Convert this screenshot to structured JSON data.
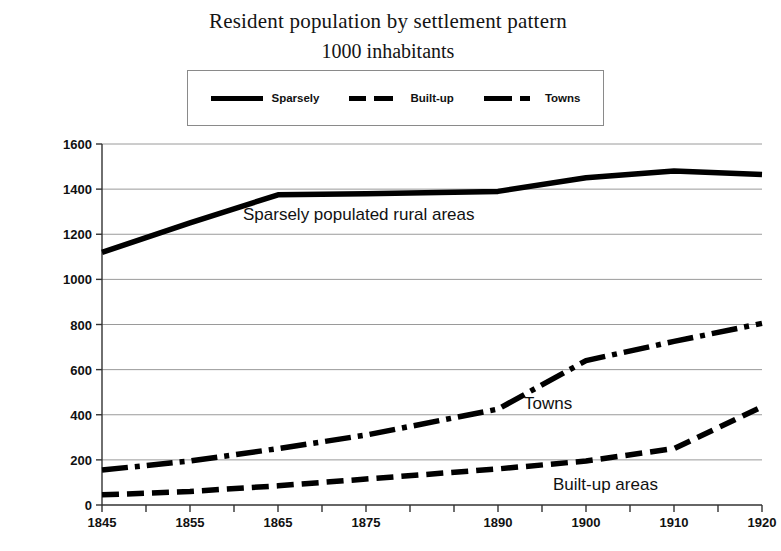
{
  "chart_data": {
    "type": "line",
    "title": "Resident population by settlement pattern",
    "subtitle": "1000 inhabitants",
    "xlabel": "",
    "ylabel": "",
    "grid": true,
    "legend_position": "top-center",
    "xlim": [
      1845,
      1920
    ],
    "ylim": [
      0,
      1600
    ],
    "ytick_values": [
      0,
      200,
      400,
      600,
      800,
      1000,
      1200,
      1400,
      1600
    ],
    "ytick_labels": [
      "0",
      "200",
      "400",
      "600",
      "800",
      "1000",
      "1200",
      "1400",
      "1600"
    ],
    "xtick_labels": [
      "1845",
      "1855",
      "1865",
      "1875",
      "1890",
      "1900",
      "1910",
      "1920"
    ],
    "xtick_positions": [
      1845,
      1855,
      1865,
      1875,
      1890,
      1900,
      1910,
      1920
    ],
    "minor_xticks": [
      1850,
      1860,
      1870,
      1880,
      1885,
      1895,
      1905,
      1915
    ],
    "x": [
      1845,
      1855,
      1865,
      1875,
      1890,
      1900,
      1910,
      1920
    ],
    "series": [
      {
        "name": "Sparsely",
        "style": "solid",
        "color": "#000000",
        "values": [
          1120,
          1250,
          1375,
          1380,
          1390,
          1450,
          1480,
          1465
        ]
      },
      {
        "name": "Built-up",
        "style": "dashed",
        "color": "#000000",
        "values": [
          45,
          60,
          85,
          115,
          160,
          195,
          250,
          435
        ]
      },
      {
        "name": "Towns",
        "style": "dash-dot",
        "color": "#000000",
        "values": [
          155,
          195,
          250,
          310,
          425,
          640,
          725,
          805
        ]
      }
    ],
    "annotations": [
      {
        "id": "sparsely",
        "text": "Sparsely populated rural areas"
      },
      {
        "id": "towns",
        "text": "Towns"
      },
      {
        "id": "builtup",
        "text": "Built-up areas"
      }
    ],
    "legend": [
      {
        "label": "Sparsely",
        "style": "solid"
      },
      {
        "label": "Built-up",
        "style": "dashed"
      },
      {
        "label": "Towns",
        "style": "dash-dot"
      }
    ],
    "colors": {
      "series": "#000000",
      "grid": "#9a9a9a",
      "axis": "#333333",
      "background": "#ffffff"
    }
  }
}
